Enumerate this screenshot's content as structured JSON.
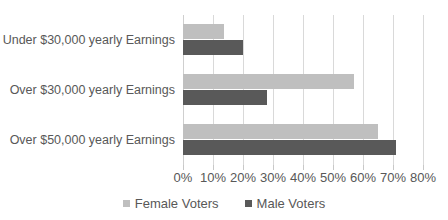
{
  "chart_data": {
    "type": "bar",
    "orientation": "horizontal",
    "title": "",
    "xlabel": "",
    "ylabel": "",
    "xlim": [
      0,
      80
    ],
    "xtick_step": 10,
    "grid": true,
    "legend_position": "bottom",
    "categories": [
      "Under $30,000 yearly Earnings",
      "Over $30,000 yearly Earnings",
      "Over $50,000 yearly Earnings"
    ],
    "xtick_labels": [
      "0%",
      "10%",
      "20%",
      "30%",
      "40%",
      "50%",
      "60%",
      "70%",
      "80%"
    ],
    "xtick_values": [
      0,
      10,
      20,
      30,
      40,
      50,
      60,
      70,
      80
    ],
    "series": [
      {
        "name": "Female Voters",
        "color": "#bfbfbf",
        "values": [
          13.5,
          57,
          65
        ]
      },
      {
        "name": "Male Voters",
        "color": "#595959",
        "values": [
          20,
          28,
          71
        ]
      }
    ]
  },
  "legend": {
    "items": [
      {
        "label": "Female Voters",
        "color": "#bfbfbf"
      },
      {
        "label": "Male Voters",
        "color": "#595959"
      }
    ]
  },
  "colors": {
    "female": "#bfbfbf",
    "male": "#595959",
    "gridline": "#d9d9d9",
    "text": "#585858",
    "background": "#ffffff"
  }
}
